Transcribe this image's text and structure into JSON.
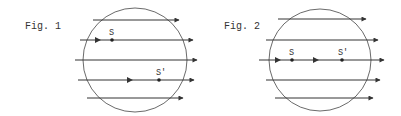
{
  "figures": [
    {
      "caption": "Fig. 1",
      "points": [
        {
          "label": "S"
        },
        {
          "label": "S'"
        }
      ]
    },
    {
      "caption": "Fig. 2",
      "points": [
        {
          "label": "S"
        },
        {
          "label": "S'"
        }
      ]
    }
  ],
  "colors": {
    "ink": "#333333",
    "background": "#ffffff"
  }
}
